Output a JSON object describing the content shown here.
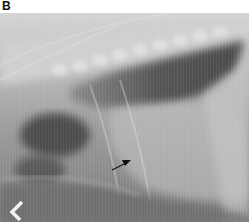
{
  "figure": {
    "panel_label": "B",
    "image_description": "Lateral thoracic radiograph",
    "annotation": {
      "type": "arrow",
      "direction": "up-right",
      "color": "#111111"
    },
    "marker": {
      "type": "chevron",
      "glyph": "<",
      "color": "#f2f2f2"
    }
  }
}
